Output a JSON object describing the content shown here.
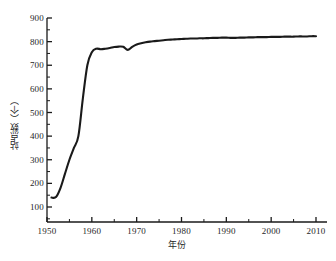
{
  "chart_data": {
    "type": "line",
    "title": "",
    "xlabel": "年份",
    "ylabel": "站点数（个）",
    "xlim": [
      1950,
      2010
    ],
    "ylim": [
      100,
      900
    ],
    "grid": false,
    "legend": null,
    "xticks": [
      1950,
      1960,
      1970,
      1980,
      1990,
      2000,
      2010
    ],
    "xtick_labels": [
      "1950",
      "1960",
      "1970",
      "1980",
      "1990",
      "2000",
      "2010"
    ],
    "yticks": [
      100,
      200,
      300,
      400,
      500,
      600,
      700,
      800,
      900
    ],
    "ytick_labels": [
      "100",
      "200",
      "300",
      "400",
      "500",
      "600",
      "700",
      "800",
      "900"
    ],
    "minor_ticks": true,
    "line_color": "#1a1a1a",
    "line_width": 2.1,
    "series": [
      {
        "name": "站点数",
        "x": [
          1951,
          1952,
          1953,
          1954,
          1955,
          1956,
          1957,
          1958,
          1959,
          1960,
          1961,
          1962,
          1963,
          1964,
          1965,
          1966,
          1967,
          1968,
          1969,
          1970,
          1971,
          1972,
          1973,
          1974,
          1975,
          1976,
          1977,
          1978,
          1979,
          1980,
          1981,
          1982,
          1983,
          1984,
          1985,
          1986,
          1987,
          1988,
          1989,
          1990,
          1991,
          1992,
          1993,
          1994,
          1995,
          1996,
          1997,
          1998,
          1999,
          2000,
          2001,
          2002,
          2003,
          2004,
          2005,
          2006,
          2007,
          2008,
          2009,
          2010
        ],
        "y": [
          140,
          142,
          180,
          240,
          300,
          350,
          400,
          560,
          700,
          755,
          770,
          768,
          770,
          773,
          777,
          779,
          778,
          765,
          778,
          788,
          793,
          797,
          800,
          802,
          804,
          806,
          808,
          809,
          810,
          811,
          812,
          813,
          813,
          814,
          814,
          815,
          816,
          816,
          817,
          817,
          816,
          816,
          817,
          817,
          818,
          818,
          819,
          819,
          819,
          820,
          820,
          820,
          821,
          821,
          821,
          822,
          822,
          822,
          823,
          823
        ]
      }
    ],
    "annotations": []
  },
  "axis": {
    "y_title": "站点数（个）",
    "x_title": "年份"
  }
}
